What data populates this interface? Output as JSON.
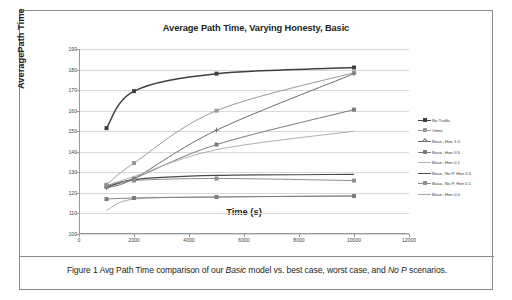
{
  "figure": {
    "caption_prefix": "Figure 1 Avg Path Time comparison of our ",
    "caption_em1": "Basic",
    "caption_mid": " model vs. best case, worst case, and ",
    "caption_em2": "No P",
    "caption_suffix": " scenarios."
  },
  "chart_data": {
    "type": "line",
    "title": "Average Path Time, Varying Honesty, Basic",
    "xlabel": "Time (s)",
    "ylabel": "AveragePath Time",
    "x": [
      1000,
      2000,
      5000,
      10000
    ],
    "xlim": [
      0,
      12000
    ],
    "ylim": [
      100,
      190
    ],
    "xticks": [
      0,
      2000,
      4000,
      6000,
      8000,
      10000,
      12000
    ],
    "yticks": [
      100,
      110,
      120,
      130,
      140,
      150,
      160,
      170,
      180,
      190
    ],
    "grid": true,
    "legend_position": "right",
    "series": [
      {
        "name": "No Traffic",
        "values": [
          151.5,
          169.5,
          178.0,
          181.0
        ],
        "color": "#3f3f3f",
        "width": 1.5,
        "marker": "square"
      },
      {
        "name": "Omni",
        "values": [
          124.0,
          134.5,
          160.0,
          178.5
        ],
        "color": "#9a9a9a",
        "width": 1.0,
        "marker": "square"
      },
      {
        "name": "Basic, Hon 1.0",
        "values": [
          122.5,
          127.0,
          150.5,
          178.0
        ],
        "color": "#6e6e6e",
        "width": 1.0,
        "marker": "plus"
      },
      {
        "name": "Basic, Hon 0.5",
        "values": [
          123.0,
          127.0,
          143.5,
          160.5
        ],
        "color": "#7c7c7c",
        "width": 1.0,
        "marker": "square"
      },
      {
        "name": "Basic, Hon 0.1",
        "values": [
          123.5,
          128.0,
          141.0,
          150.0
        ],
        "color": "#b0b0b0",
        "width": 1.0,
        "marker": "none"
      },
      {
        "name": "Basic, No P, Hon 0.5",
        "values": [
          122.5,
          126.5,
          128.5,
          129.0
        ],
        "color": "#4a4a4a",
        "width": 1.2,
        "marker": "none"
      },
      {
        "name": "Basic, No P, Hon 0.1",
        "values": [
          123.5,
          126.0,
          127.0,
          126.0
        ],
        "color": "#8e8e8e",
        "width": 1.0,
        "marker": "square"
      },
      {
        "name": "Basic, Hon 0.0",
        "values": [
          111.5,
          117.0,
          118.0,
          118.5
        ],
        "color": "#a6a6a6",
        "width": 1.0,
        "marker": "none"
      }
    ],
    "extra_marked_series": [
      {
        "name": "Basic, Hon 1.0 lower",
        "values": [
          117.0,
          117.5,
          118.0,
          118.5
        ],
        "color": "#7c7c7c",
        "marker": "square"
      }
    ]
  }
}
